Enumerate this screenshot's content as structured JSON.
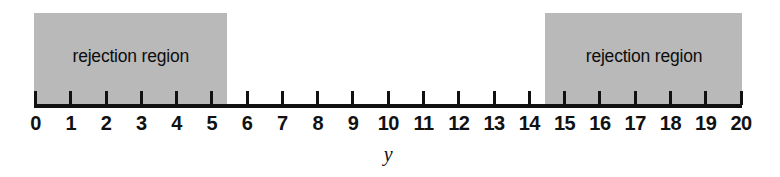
{
  "figure": {
    "type": "number-line-rejection-region",
    "axis_variable": "y",
    "regions": [
      {
        "id": "left",
        "label": "rejection region",
        "from": 0,
        "to": 5.4
      },
      {
        "id": "right",
        "label": "rejection region",
        "from": 14.5,
        "to": 20
      }
    ],
    "colors": {
      "shade": "#b9b9b9",
      "axis": "#111111",
      "text": "#111111",
      "background": "#ffffff"
    }
  },
  "chart_data": {
    "type": "table",
    "title": "",
    "subtitle": "",
    "xlabel": "y",
    "ylabel": "",
    "xlim": [
      0,
      20
    ],
    "grid": false,
    "legend": "none",
    "tick_values": [
      0,
      1,
      2,
      3,
      4,
      5,
      6,
      7,
      8,
      9,
      10,
      11,
      12,
      13,
      14,
      15,
      16,
      17,
      18,
      19,
      20
    ],
    "tick_labels": [
      "0",
      "1",
      "2",
      "3",
      "4",
      "5",
      "6",
      "7",
      "8",
      "9",
      "10",
      "11",
      "12",
      "13",
      "14",
      "15",
      "16",
      "17",
      "18",
      "19",
      "20"
    ],
    "annotations": [
      {
        "text": "rejection region",
        "x_start": 0,
        "x_end": 5.4
      },
      {
        "text": "rejection region",
        "x_start": 14.5,
        "x_end": 20
      },
      {
        "text": "y",
        "x": 10
      }
    ],
    "shaded_intervals": [
      [
        0,
        5.4
      ],
      [
        14.5,
        20
      ]
    ],
    "acceptance_interval": [
      5.4,
      14.5
    ]
  }
}
